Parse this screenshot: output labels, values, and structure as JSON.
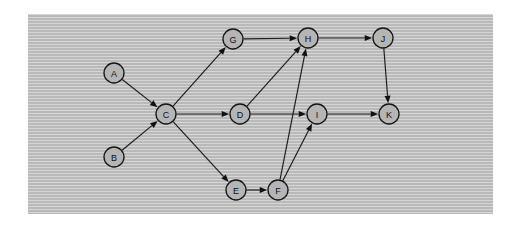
{
  "panel": {
    "background_color": "#b9b9b9",
    "border_color": "#b9b9b9",
    "x": 28,
    "y": 14,
    "width": 465,
    "height": 200
  },
  "graph": {
    "type": "directed-graph",
    "node_fill": "#b5b5b5",
    "node_stroke": "#151515",
    "edge_color": "#1b1b1b",
    "node_radius": 10,
    "nodes": [
      {
        "id": "A",
        "label": "A",
        "x": 114,
        "y": 73
      },
      {
        "id": "B",
        "label": "B",
        "x": 114,
        "y": 157
      },
      {
        "id": "C",
        "label": "C",
        "x": 166,
        "y": 114
      },
      {
        "id": "D",
        "label": "D",
        "x": 240,
        "y": 114
      },
      {
        "id": "E",
        "label": "E",
        "x": 236,
        "y": 190
      },
      {
        "id": "F",
        "label": "F",
        "x": 278,
        "y": 190
      },
      {
        "id": "G",
        "label": "G",
        "x": 233,
        "y": 39
      },
      {
        "id": "H",
        "label": "H",
        "x": 308,
        "y": 38
      },
      {
        "id": "I",
        "label": "I",
        "x": 317,
        "y": 114
      },
      {
        "id": "J",
        "label": "J",
        "x": 383,
        "y": 38
      },
      {
        "id": "K",
        "label": "K",
        "x": 389,
        "y": 114
      }
    ],
    "edges": [
      {
        "from": "A",
        "to": "C"
      },
      {
        "from": "B",
        "to": "C"
      },
      {
        "from": "C",
        "to": "G"
      },
      {
        "from": "C",
        "to": "D"
      },
      {
        "from": "C",
        "to": "E"
      },
      {
        "from": "G",
        "to": "H"
      },
      {
        "from": "D",
        "to": "H"
      },
      {
        "from": "D",
        "to": "I"
      },
      {
        "from": "E",
        "to": "F"
      },
      {
        "from": "F",
        "to": "H"
      },
      {
        "from": "F",
        "to": "I"
      },
      {
        "from": "H",
        "to": "J"
      },
      {
        "from": "I",
        "to": "K"
      },
      {
        "from": "J",
        "to": "K"
      }
    ]
  }
}
